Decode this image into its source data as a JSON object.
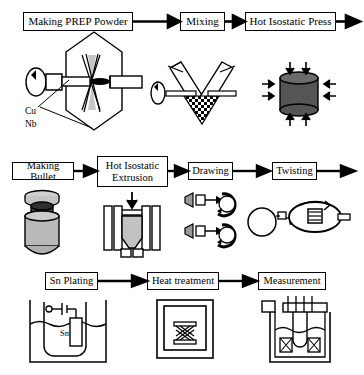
{
  "diagram": {
    "type": "process-flowchart",
    "rows": 3,
    "line_color": "#000000",
    "fill_light": "#c9c9c9",
    "fill_dark": "#4a4a4a",
    "background": "#ffffff"
  },
  "rows": [
    {
      "id": "row-1",
      "stages": [
        {
          "id": "making-prep-powder",
          "label": "Making PREP Powder",
          "box": {
            "x": 23,
            "y": 12,
            "w": 110,
            "h": 19,
            "font": 11
          },
          "illustration": "prep-atomizer",
          "annotations": [
            {
              "text": "Cu",
              "x": 25,
              "y": 109
            },
            {
              "text": "Nb",
              "x": 25,
              "y": 121
            }
          ]
        },
        {
          "id": "mixing",
          "label": "Mixing",
          "box": {
            "x": 180,
            "y": 12,
            "w": 45,
            "h": 19,
            "font": 11
          },
          "illustration": "v-mixer",
          "annotations": []
        },
        {
          "id": "hot-isostatic-press",
          "label": "Hot Isostatic Press",
          "box": {
            "x": 245,
            "y": 12,
            "w": 91,
            "h": 19,
            "font": 11
          },
          "illustration": "hip-cylinder",
          "annotations": []
        }
      ],
      "arrows": [
        {
          "from": 133,
          "to": 178,
          "y": 21
        },
        {
          "from": 225,
          "to": 243,
          "y": 21
        },
        {
          "from": 336,
          "to": 360,
          "y": 21
        }
      ]
    },
    {
      "id": "row-2",
      "stages": [
        {
          "id": "making-bullet",
          "label": "Making Bullet",
          "box": {
            "x": 12,
            "y": 162,
            "w": 62,
            "h": 18,
            "font": 10.5
          },
          "illustration": "bullet-billet",
          "annotations": []
        },
        {
          "id": "hot-isostatic-extrusion",
          "label": "Hot Isostatic\nExtrusion",
          "box": {
            "x": 97,
            "y": 156,
            "w": 71,
            "h": 31,
            "font": 10.5
          },
          "illustration": "extrusion-press",
          "annotations": []
        },
        {
          "id": "drawing",
          "label": "Drawing",
          "box": {
            "x": 188,
            "y": 162,
            "w": 45,
            "h": 18,
            "font": 10.5
          },
          "illustration": "drawing-dies",
          "annotations": []
        },
        {
          "id": "twisting",
          "label": "Twisting",
          "box": {
            "x": 272,
            "y": 162,
            "w": 45,
            "h": 18,
            "font": 10.5
          },
          "illustration": "twisting-rig",
          "annotations": []
        }
      ],
      "arrows": [
        {
          "from": 74,
          "to": 95,
          "y": 171
        },
        {
          "from": 168,
          "to": 186,
          "y": 171
        },
        {
          "from": 233,
          "to": 270,
          "y": 171
        },
        {
          "from": 317,
          "to": 355,
          "y": 171
        }
      ]
    },
    {
      "id": "row-3",
      "stages": [
        {
          "id": "sn-plating",
          "label": "Sn Plating",
          "box": {
            "x": 45,
            "y": 272,
            "w": 53,
            "h": 18,
            "font": 10.5
          },
          "illustration": "plating-bath",
          "annotations": [
            {
              "text": "Sn",
              "x": 119,
              "y": 330
            }
          ]
        },
        {
          "id": "heat-treatment",
          "label": "Heat treatment",
          "box": {
            "x": 147,
            "y": 272,
            "w": 72,
            "h": 18,
            "font": 10.5
          },
          "illustration": "furnace",
          "annotations": []
        },
        {
          "id": "measurement",
          "label": "Measurement",
          "box": {
            "x": 258,
            "y": 272,
            "w": 68,
            "h": 18,
            "font": 10.5
          },
          "illustration": "cryostat-probe",
          "annotations": []
        }
      ],
      "arrows": [
        {
          "from": 98,
          "to": 145,
          "y": 281
        },
        {
          "from": 219,
          "to": 256,
          "y": 281
        }
      ]
    }
  ]
}
